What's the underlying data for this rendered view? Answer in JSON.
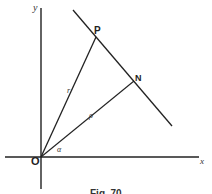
{
  "figure": {
    "caption": "Fig. 70",
    "labels": {
      "y_axis": "y",
      "x_axis": "x",
      "origin": "O",
      "point_p": "P",
      "point_n": "N",
      "segment_op": "r",
      "segment_on": "ρ",
      "angle": "α"
    },
    "colors": {
      "line": "#222222",
      "background": "#ffffff"
    }
  }
}
